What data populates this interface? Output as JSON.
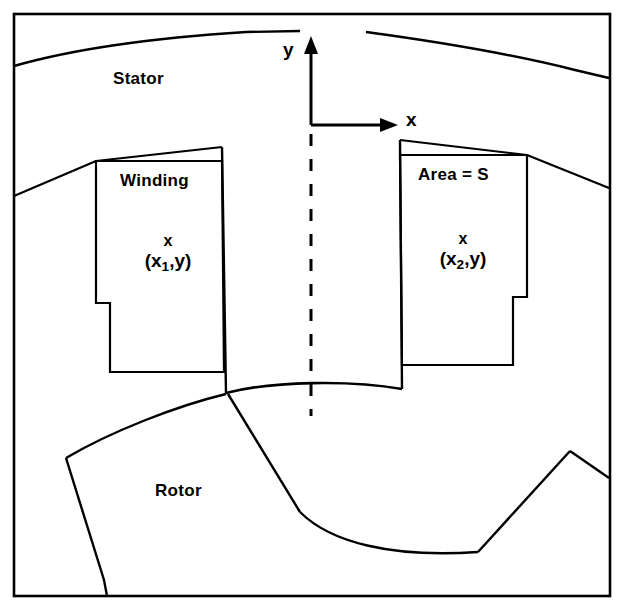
{
  "figure": {
    "stroke_color": "#000000",
    "background_color": "#ffffff"
  },
  "labels": {
    "stator": "Stator",
    "rotor": "Rotor",
    "winding": "Winding",
    "area": "Area = S",
    "axis_y": "y",
    "axis_x": "x",
    "point_mark": "x",
    "left_point_prefix": "(x",
    "left_point_sub": "1",
    "left_point_suffix": ",y)",
    "right_point_prefix": "(x",
    "right_point_sub": "2",
    "right_point_suffix": ",y)"
  },
  "geometry": {
    "frame": {
      "x": 14,
      "y": 14,
      "width": 596,
      "height": 582
    },
    "origin": {
      "x": 311,
      "y": 125
    },
    "y_axis_top": 42,
    "x_axis_right": 398,
    "centerline_dash": {
      "x": 311,
      "y_top": 133,
      "y_bottom": 415
    }
  }
}
